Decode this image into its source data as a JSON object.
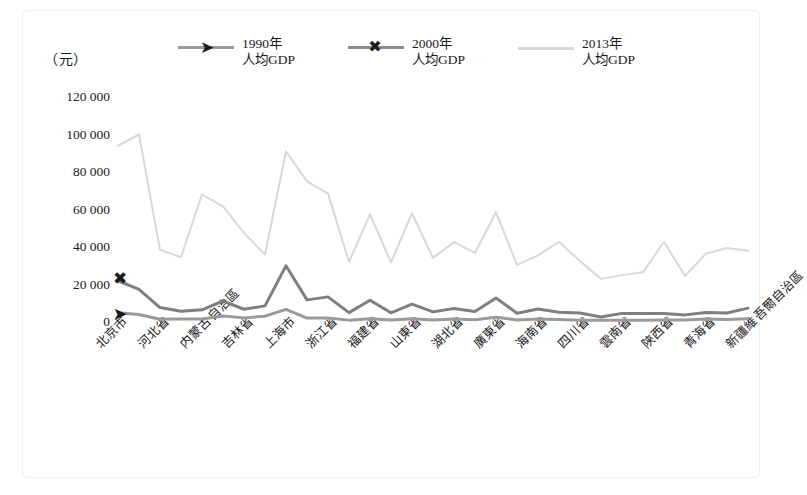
{
  "axis": {
    "unit_label": "（元）",
    "y_ticks": [
      "120 000",
      "100 000",
      "80 000",
      "60 000",
      "40 000",
      "20 000",
      "0"
    ],
    "y_tick_values": [
      120000,
      100000,
      80000,
      60000,
      40000,
      20000,
      0
    ]
  },
  "legend": {
    "items": [
      {
        "label_line1": "1990年",
        "label_line2": "人均GDP",
        "marker": "greater-than-marker",
        "glyph": "➤",
        "color": "#8c8c8c"
      },
      {
        "label_line1": "2000年",
        "label_line2": "人均GDP",
        "marker": "cross-x-marker",
        "glyph": "✖",
        "color": "#8c8c8c"
      },
      {
        "label_line1": "2013年",
        "label_line2": "人均GDP",
        "marker": "none",
        "glyph": "",
        "color": "#d4d4d4"
      }
    ]
  },
  "chart_data": {
    "type": "line",
    "title": "",
    "xlabel": "",
    "ylabel": "（元）",
    "ylim": [
      0,
      120000
    ],
    "ytick_step": 20000,
    "grid": false,
    "legend_position": "top",
    "categories": [
      "北京市",
      "天津市",
      "河北省",
      "山西省",
      "内蒙古自治區",
      "遼寧省",
      "吉林省",
      "黑龍江省",
      "上海市",
      "江蘇省",
      "浙江省",
      "安徽省",
      "福建省",
      "江西省",
      "山東省",
      "河南省",
      "湖北省",
      "湖南省",
      "廣東省",
      "廣西壯族自治區",
      "海南省",
      "重慶市",
      "四川省",
      "貴州省",
      "雲南省",
      "西藏自治區",
      "陝西省",
      "甘肅省",
      "青海省",
      "寧夏回族自治區",
      "新疆維吾爾自治區"
    ],
    "visible_xtick_labels": [
      "北京市",
      "河北省",
      "内蒙古自治區",
      "吉林省",
      "上海市",
      "浙江省",
      "福建省",
      "山東省",
      "湖北省",
      "廣東省",
      "海南省",
      "四川省",
      "雲南省",
      "陝西省",
      "青海省",
      "新疆維吾爾自治區"
    ],
    "visible_xtick_indices": [
      0,
      2,
      4,
      6,
      8,
      10,
      12,
      14,
      16,
      18,
      20,
      22,
      24,
      26,
      28,
      30
    ],
    "series": [
      {
        "name": "1990年人均GDP",
        "color": "#9a9a9a",
        "values": [
          4900,
          4000,
          1500,
          1600,
          1600,
          3200,
          2200,
          3100,
          6700,
          2100,
          2100,
          1000,
          1800,
          1100,
          1800,
          1100,
          1600,
          1200,
          2500,
          1100,
          1600,
          1300,
          1000,
          900,
          1000,
          1000,
          1100,
          1100,
          1600,
          1400,
          1800
        ]
      },
      {
        "name": "2000年人均GDP",
        "color": "#7f7f7f",
        "values": [
          22000,
          17400,
          7700,
          5700,
          6500,
          11200,
          6800,
          8600,
          30000,
          11800,
          13400,
          5000,
          11600,
          4900,
          9500,
          5400,
          7200,
          5600,
          12800,
          4700,
          6900,
          5200,
          4800,
          2700,
          4600,
          4500,
          4500,
          3800,
          5100,
          4800,
          7400
        ]
      },
      {
        "name": "2013年人均GDP",
        "color": "#d8d8d8",
        "values": [
          94000,
          100000,
          38500,
          34500,
          68000,
          61700,
          47500,
          36000,
          91000,
          75000,
          68500,
          32000,
          57500,
          31800,
          58000,
          34200,
          42600,
          36900,
          58500,
          30500,
          35500,
          42800,
          32500,
          23000,
          25000,
          26500,
          42800,
          24500,
          36500,
          39500,
          38000
        ]
      }
    ]
  }
}
